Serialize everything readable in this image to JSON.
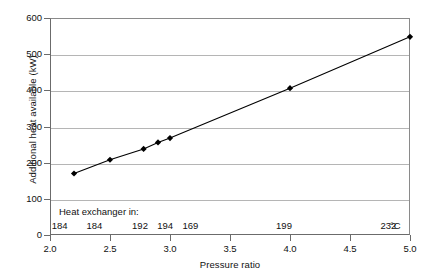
{
  "chart_data": {
    "type": "line",
    "title": "",
    "subtitle": "",
    "xlabel": "Pressure ratio",
    "ylabel": "Additional heat available (kW)",
    "xlim": [
      2.0,
      5.0
    ],
    "ylim": [
      0,
      600
    ],
    "grid": true,
    "grid_axis": "y",
    "legend": "none",
    "marker": "diamond",
    "line_color": "#000000",
    "marker_color": "#000000",
    "grid_color": "#b5b5b5",
    "axis_color": "#6b6b6b",
    "background": "#ffffff",
    "xticks": [
      "2.0",
      "2.5",
      "3.0",
      "3.5",
      "4.0",
      "4.5",
      "5.0"
    ],
    "xtick_values": [
      2.0,
      2.5,
      3.0,
      3.5,
      4.0,
      4.5,
      5.0
    ],
    "yticks": [
      "0",
      "100",
      "200",
      "300",
      "400",
      "500",
      "600"
    ],
    "ytick_values": [
      0,
      100,
      200,
      300,
      400,
      500,
      600
    ],
    "series": [
      {
        "name": "Additional heat available",
        "x": [
          2.2,
          2.5,
          2.78,
          2.9,
          3.0,
          4.0,
          5.0
        ],
        "y": [
          170,
          208,
          238,
          256,
          268,
          406,
          548
        ]
      }
    ],
    "annotations": {
      "label": "Heat exchanger in:",
      "unit": "°C",
      "points": [
        {
          "x": 2.08,
          "value": "184"
        },
        {
          "x": 2.37,
          "value": "184"
        },
        {
          "x": 2.75,
          "value": "192"
        },
        {
          "x": 2.96,
          "value": "194"
        },
        {
          "x": 3.17,
          "value": "169"
        },
        {
          "x": 3.95,
          "value": "199"
        },
        {
          "x": 4.82,
          "value": "232"
        }
      ]
    }
  }
}
